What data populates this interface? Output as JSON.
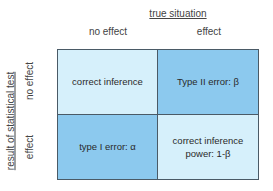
{
  "diagram": {
    "column_header": "true situation",
    "row_header": "result of statistical test",
    "columns": [
      "no effect",
      "effect"
    ],
    "rows": [
      "no effect",
      "effect"
    ],
    "cells": [
      {
        "line1": "correct inference",
        "line2": "",
        "shade": "light"
      },
      {
        "line1": "Type II error: β",
        "line2": "",
        "shade": "dark"
      },
      {
        "line1": "type I error: α",
        "line2": "",
        "shade": "dark"
      },
      {
        "line1": "correct inference",
        "line2": "power: 1-β",
        "shade": "light"
      }
    ],
    "colors": {
      "light": "#d6f0fb",
      "dark": "#8cc9ee",
      "border": "#4a5a66"
    }
  }
}
